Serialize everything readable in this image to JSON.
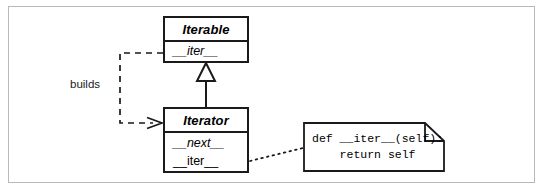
{
  "diagram": {
    "frame_color": "#b9b9b9",
    "line_color": "#1a1a1a",
    "background": "#ffffff"
  },
  "classes": [
    {
      "id": "iterable",
      "name": "Iterable",
      "stereotype": "abstract",
      "members": [
        {
          "label": "__iter__",
          "abstract": true
        }
      ]
    },
    {
      "id": "iterator",
      "name": "Iterator",
      "stereotype": "abstract",
      "members": [
        {
          "label": "__next__",
          "abstract": true
        },
        {
          "label": "__iter__",
          "abstract": false
        }
      ]
    }
  ],
  "relationships": [
    {
      "id": "generalization",
      "type": "generalization",
      "from": "Iterator",
      "to": "Iterable",
      "label": "",
      "arrow": "hollow-triangle",
      "line": "solid"
    },
    {
      "id": "dependency",
      "type": "dependency",
      "from": "Iterable",
      "to": "Iterator",
      "label": "builds",
      "arrow": "open-arrow",
      "line": "dashed"
    },
    {
      "id": "note-anchor",
      "type": "note-link",
      "from": "Iterator.__iter__",
      "to": "code-note",
      "label": "",
      "arrow": "none",
      "line": "dotted"
    }
  ],
  "note": {
    "id": "code-note",
    "language": "python",
    "code_line_1": "def __iter__(self):",
    "code_line_2": "    return self",
    "code": "def __iter__(self):\n    return self"
  }
}
